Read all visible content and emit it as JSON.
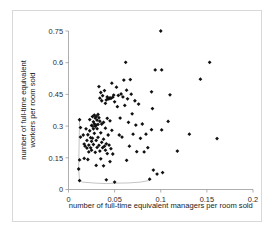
{
  "chart_data": {
    "type": "scatter",
    "title": "",
    "xlabel": "number of full-time equivalent managers per room sold",
    "ylabel": "number of full-time equivalent workers per room sold",
    "ylabel_line1": "number of full-time equivalent",
    "ylabel_line2": "workers per room sold",
    "xlim": [
      0,
      0.2
    ],
    "ylim": [
      0,
      0.75
    ],
    "xticks": [
      0,
      0.05,
      0.1,
      0.15,
      0.2
    ],
    "xtick_labels": [
      "0",
      "0.05",
      "0.1",
      "0.15",
      "0.2"
    ],
    "yticks": [
      0,
      0.15,
      0.3,
      0.45,
      0.6,
      0.75
    ],
    "ytick_labels": [
      "0",
      "0.15",
      "0.3",
      "0.45",
      "0.6",
      "0.75"
    ],
    "grid": false,
    "legend": null,
    "marker": "diamond",
    "marker_color": "#111111",
    "frame_color": "#d8d8d8",
    "axis_color": "#9a9a9a",
    "series": [
      {
        "name": "hotels",
        "points": [
          [
            0.012,
            0.33
          ],
          [
            0.013,
            0.293
          ],
          [
            0.013,
            0.248
          ],
          [
            0.012,
            0.14
          ],
          [
            0.011,
            0.097
          ],
          [
            0.012,
            0.042
          ],
          [
            0.016,
            0.258
          ],
          [
            0.017,
            0.215
          ],
          [
            0.017,
            0.147
          ],
          [
            0.018,
            0.205
          ],
          [
            0.019,
            0.287
          ],
          [
            0.02,
            0.232
          ],
          [
            0.02,
            0.196
          ],
          [
            0.021,
            0.259
          ],
          [
            0.021,
            0.142
          ],
          [
            0.022,
            0.21
          ],
          [
            0.022,
            0.178
          ],
          [
            0.023,
            0.331
          ],
          [
            0.023,
            0.278
          ],
          [
            0.024,
            0.245
          ],
          [
            0.024,
            0.197
          ],
          [
            0.025,
            0.303
          ],
          [
            0.025,
            0.228
          ],
          [
            0.025,
            0.186
          ],
          [
            0.026,
            0.345
          ],
          [
            0.026,
            0.3
          ],
          [
            0.026,
            0.243
          ],
          [
            0.027,
            0.32
          ],
          [
            0.027,
            0.287
          ],
          [
            0.027,
            0.213
          ],
          [
            0.028,
            0.352
          ],
          [
            0.028,
            0.311
          ],
          [
            0.028,
            0.266
          ],
          [
            0.029,
            0.338
          ],
          [
            0.029,
            0.299
          ],
          [
            0.029,
            0.176
          ],
          [
            0.03,
            0.346
          ],
          [
            0.03,
            0.305
          ],
          [
            0.03,
            0.232
          ],
          [
            0.03,
            0.114
          ],
          [
            0.031,
            0.328
          ],
          [
            0.031,
            0.288
          ],
          [
            0.031,
            0.199
          ],
          [
            0.032,
            0.355
          ],
          [
            0.032,
            0.308
          ],
          [
            0.032,
            0.247
          ],
          [
            0.033,
            0.487
          ],
          [
            0.033,
            0.34
          ],
          [
            0.033,
            0.209
          ],
          [
            0.034,
            0.432
          ],
          [
            0.034,
            0.323
          ],
          [
            0.034,
            0.182
          ],
          [
            0.035,
            0.459
          ],
          [
            0.035,
            0.268
          ],
          [
            0.035,
            0.145
          ],
          [
            0.036,
            0.42
          ],
          [
            0.036,
            0.31
          ],
          [
            0.036,
            0.223
          ],
          [
            0.037,
            0.444
          ],
          [
            0.037,
            0.198
          ],
          [
            0.038,
            0.318
          ],
          [
            0.038,
            0.238
          ],
          [
            0.038,
            0.112
          ],
          [
            0.039,
            0.468
          ],
          [
            0.039,
            0.205
          ],
          [
            0.04,
            0.408
          ],
          [
            0.04,
            0.29
          ],
          [
            0.04,
            0.186
          ],
          [
            0.041,
            0.424
          ],
          [
            0.041,
            0.216
          ],
          [
            0.041,
            0.046
          ],
          [
            0.042,
            0.438
          ],
          [
            0.042,
            0.337
          ],
          [
            0.042,
            0.17
          ],
          [
            0.043,
            0.429
          ],
          [
            0.043,
            0.258
          ],
          [
            0.044,
            0.43
          ],
          [
            0.044,
            0.21
          ],
          [
            0.045,
            0.434
          ],
          [
            0.045,
            0.325
          ],
          [
            0.045,
            0.132
          ],
          [
            0.046,
            0.431
          ],
          [
            0.046,
            0.193
          ],
          [
            0.047,
            0.503
          ],
          [
            0.047,
            0.28
          ],
          [
            0.048,
            0.437
          ],
          [
            0.048,
            0.168
          ],
          [
            0.049,
            0.447
          ],
          [
            0.05,
            0.415
          ],
          [
            0.05,
            0.035
          ],
          [
            0.052,
            0.484
          ],
          [
            0.053,
            0.392
          ],
          [
            0.054,
            0.445
          ],
          [
            0.055,
            0.258
          ],
          [
            0.056,
            0.338
          ],
          [
            0.057,
            0.452
          ],
          [
            0.058,
            0.248
          ],
          [
            0.059,
            0.438
          ],
          [
            0.06,
            0.518
          ],
          [
            0.061,
            0.398
          ],
          [
            0.062,
            0.602
          ],
          [
            0.063,
            0.47
          ],
          [
            0.063,
            0.138
          ],
          [
            0.064,
            0.429
          ],
          [
            0.065,
            0.318
          ],
          [
            0.066,
            0.205
          ],
          [
            0.067,
            0.52
          ],
          [
            0.068,
            0.451
          ],
          [
            0.069,
            0.358
          ],
          [
            0.07,
            0.262
          ],
          [
            0.072,
            0.42
          ],
          [
            0.073,
            0.305
          ],
          [
            0.074,
            0.179
          ],
          [
            0.076,
            0.404
          ],
          [
            0.078,
            0.242
          ],
          [
            0.08,
            0.31
          ],
          [
            0.082,
            0.178
          ],
          [
            0.084,
            0.262
          ],
          [
            0.086,
            0.198
          ],
          [
            0.088,
            0.049
          ],
          [
            0.09,
            0.462
          ],
          [
            0.09,
            0.283
          ],
          [
            0.091,
            0.383
          ],
          [
            0.092,
            0.092
          ],
          [
            0.094,
            0.566
          ],
          [
            0.096,
            0.073
          ],
          [
            0.1,
            0.75
          ],
          [
            0.101,
            0.566
          ],
          [
            0.101,
            0.282
          ],
          [
            0.102,
            0.08
          ],
          [
            0.108,
            0.322
          ],
          [
            0.11,
            0.448
          ],
          [
            0.118,
            0.182
          ],
          [
            0.131,
            0.262
          ],
          [
            0.143,
            0.522
          ],
          [
            0.153,
            0.602
          ],
          [
            0.161,
            0.241
          ]
        ]
      }
    ],
    "frontier": {
      "name": "efficiency-frontier",
      "points": [
        [
          0.012,
          0.33
        ],
        [
          0.011,
          0.097
        ],
        [
          0.012,
          0.042
        ],
        [
          0.015,
          0.035
        ],
        [
          0.03,
          0.03
        ],
        [
          0.041,
          0.028
        ],
        [
          0.05,
          0.03
        ],
        [
          0.065,
          0.031
        ],
        [
          0.078,
          0.035
        ],
        [
          0.088,
          0.043
        ]
      ]
    }
  }
}
